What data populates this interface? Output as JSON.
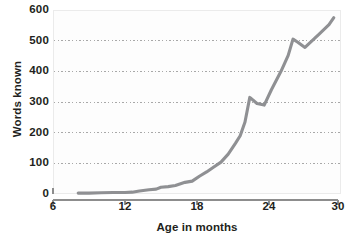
{
  "chart_data": {
    "type": "line",
    "title": "",
    "xlabel": "Age in months",
    "ylabel": "Words known",
    "xlim": [
      6,
      30
    ],
    "ylim": [
      0,
      600
    ],
    "xticks": [
      6,
      12,
      18,
      24,
      30
    ],
    "yticks": [
      0,
      100,
      200,
      300,
      400,
      500,
      600
    ],
    "grid": "horizontal-dotted",
    "legend": "none",
    "series": [
      {
        "name": "Words known",
        "color": "#8f9093",
        "x": [
          8.1,
          9.0,
          10.0,
          11.0,
          12.0,
          12.6,
          13.2,
          14.0,
          14.6,
          15.0,
          15.6,
          16.2,
          17.0,
          17.6,
          18.2,
          18.8,
          19.4,
          20.0,
          20.6,
          21.2,
          21.6,
          22.0,
          22.4,
          23.0,
          23.6,
          24.2,
          25.0,
          25.6,
          26.0,
          26.4,
          27.0,
          27.6,
          28.2,
          29.0,
          29.4
        ],
        "y": [
          3,
          3,
          4,
          5,
          5,
          6,
          10,
          14,
          16,
          22,
          24,
          28,
          38,
          42,
          58,
          72,
          88,
          104,
          130,
          165,
          190,
          235,
          315,
          295,
          290,
          340,
          400,
          452,
          505,
          495,
          478,
          500,
          522,
          552,
          575
        ]
      }
    ]
  },
  "axes": {
    "x_tick_labels": [
      "6",
      "12",
      "18",
      "24",
      "30"
    ],
    "y_tick_labels": [
      "0",
      "100",
      "200",
      "300",
      "400",
      "500",
      "600"
    ],
    "x_axis_title": "Age in months",
    "y_axis_title": "Words known"
  },
  "colors": {
    "line": "#8f9093",
    "grid": "#9a9a9a",
    "axis": "#8d8d8d",
    "text": "#231f20",
    "panel_bg": "#fdfdfd",
    "page_bg": "#ffffff"
  }
}
